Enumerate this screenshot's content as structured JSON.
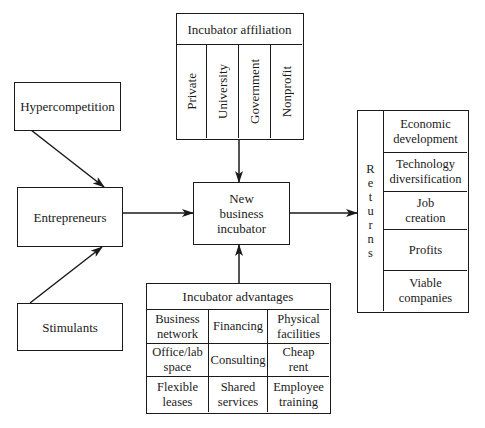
{
  "diagram": {
    "hypercompetition": "Hypercompetition",
    "entrepreneurs": "Entrepreneurs",
    "stimulants": "Stimulants",
    "incubator": {
      "line1": "New",
      "line2": "business",
      "line3": "incubator"
    },
    "affiliation": {
      "title": "Incubator affiliation",
      "items": [
        "Private",
        "University",
        "Government",
        "Nonprofit"
      ]
    },
    "advantages": {
      "title": "Incubator advantages",
      "items": [
        [
          "Business",
          "network"
        ],
        [
          "Financing",
          ""
        ],
        [
          "Physical",
          "facilities"
        ],
        [
          "Office/lab",
          "space"
        ],
        [
          "Consulting",
          ""
        ],
        [
          "Cheap",
          "rent"
        ],
        [
          "Flexible",
          "leases"
        ],
        [
          "Shared",
          "services"
        ],
        [
          "Employee",
          "training"
        ]
      ]
    },
    "returns": {
      "label_letters": [
        "R",
        "e",
        "t",
        "u",
        "r",
        "n",
        "s"
      ],
      "items": [
        [
          "Economic",
          "development"
        ],
        [
          "Technology",
          "diversification"
        ],
        [
          "Job",
          "creation"
        ],
        [
          "Profits",
          ""
        ],
        [
          "Viable",
          "companies"
        ]
      ]
    },
    "edges": [
      {
        "from": "Hypercompetition",
        "to": "Entrepreneurs"
      },
      {
        "from": "Stimulants",
        "to": "Entrepreneurs"
      },
      {
        "from": "Entrepreneurs",
        "to": "New business incubator"
      },
      {
        "from": "Incubator affiliation",
        "to": "New business incubator"
      },
      {
        "from": "Incubator advantages",
        "to": "New business incubator"
      },
      {
        "from": "New business incubator",
        "to": "Returns"
      }
    ]
  }
}
